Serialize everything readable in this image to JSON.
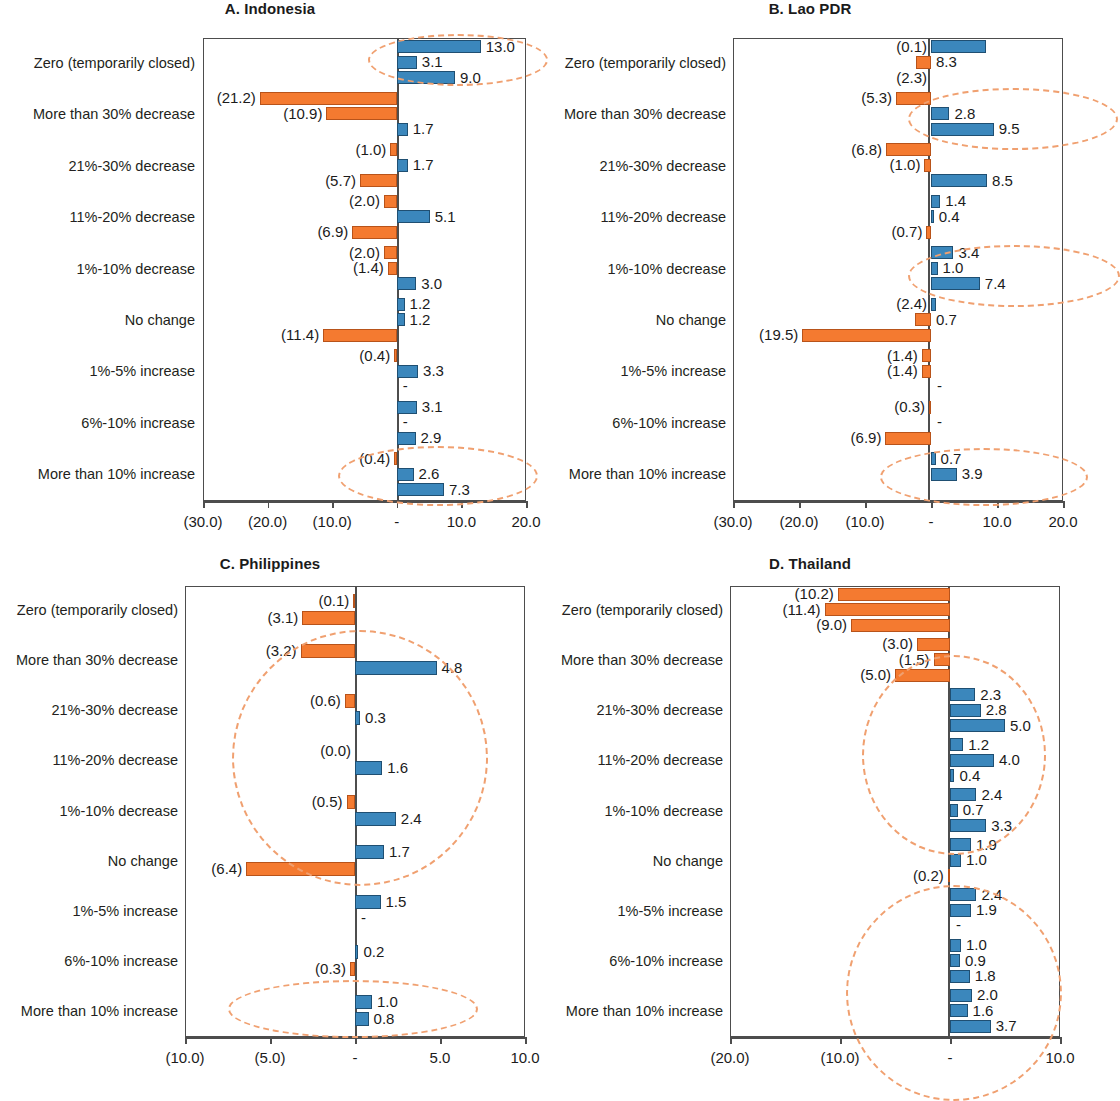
{
  "figure": {
    "panels": [
      "A. Indonesia",
      "B. Lao PDR",
      "C. Philippines",
      "D. Thailand"
    ],
    "categories": [
      "Zero (temporarily closed)",
      "More than 30% decrease",
      "21%-30% decrease",
      "11%-20% decrease",
      "1%-10% decrease",
      "No change",
      "1%-5% increase",
      "6%-10% increase",
      "More than 10% increase"
    ],
    "colors": {
      "positive": "#3b87bc",
      "negative": "#f47a30",
      "highlight": "#f0a070",
      "axis": "#4d4d4d"
    }
  },
  "chart_data": [
    {
      "type": "bar",
      "title": "A. Indonesia",
      "xlabel": "",
      "ylabel": "",
      "orientation": "horizontal",
      "xlim": [
        -30.0,
        20.0
      ],
      "xticks": [
        -30.0,
        -20.0,
        -10.0,
        0.0,
        10.0,
        20.0
      ],
      "xticklabels": [
        "(30.0)",
        "(20.0)",
        "(10.0)",
        "-",
        "10.0",
        "20.0"
      ],
      "grid": false,
      "legend": "none",
      "categories": [
        "Zero (temporarily closed)",
        "More than 30% decrease",
        "21%-30% decrease",
        "11%-20% decrease",
        "1%-10% decrease",
        "No change",
        "1%-5% increase",
        "6%-10% increase",
        "More than 10% increase"
      ],
      "series": [
        {
          "name": "row1",
          "values": [
            13.0,
            -21.2,
            -1.0,
            -2.0,
            -2.0,
            1.2,
            -0.4,
            3.1,
            -0.4
          ]
        },
        {
          "name": "row2",
          "values": [
            3.1,
            -10.9,
            1.7,
            5.1,
            -1.4,
            1.2,
            3.3,
            0.0,
            2.6
          ]
        },
        {
          "name": "row3",
          "values": [
            9.0,
            1.7,
            -5.7,
            -6.9,
            3.0,
            -11.4,
            0.0,
            2.9,
            7.3
          ]
        }
      ],
      "labels": [
        [
          "13.0",
          "3.1",
          "9.0"
        ],
        [
          "(21.2)",
          "(10.9)",
          "1.7"
        ],
        [
          "(1.0)",
          "1.7",
          "(5.7)"
        ],
        [
          "(2.0)",
          "5.1",
          "(6.9)"
        ],
        [
          "(2.0)",
          "(1.4)",
          "3.0"
        ],
        [
          "1.2",
          "1.2",
          "(11.4)"
        ],
        [
          "(0.4)",
          "3.3",
          "-"
        ],
        [
          "3.1",
          "-",
          "2.9"
        ],
        [
          "(0.4)",
          "2.6",
          "7.3"
        ]
      ],
      "highlight_regions": [
        "Zero (temporarily closed)",
        "More than 10% increase"
      ]
    },
    {
      "type": "bar",
      "title": "B. Lao PDR",
      "xlabel": "",
      "ylabel": "",
      "orientation": "horizontal",
      "xlim": [
        -30.0,
        20.0
      ],
      "xticks": [
        -30.0,
        -20.0,
        -10.0,
        0.0,
        10.0,
        20.0
      ],
      "xticklabels": [
        "(30.0)",
        "(20.0)",
        "(10.0)",
        "-",
        "10.0",
        "20.0"
      ],
      "grid": false,
      "legend": "none",
      "categories": [
        "Zero (temporarily closed)",
        "More than 30% decrease",
        "21%-30% decrease",
        "11%-20% decrease",
        "1%-10% decrease",
        "No change",
        "1%-5% increase",
        "6%-10% increase",
        "More than 10% increase"
      ],
      "series": [
        {
          "name": "row1",
          "values": [
            8.3,
            -5.3,
            -6.8,
            1.4,
            3.4,
            0.7,
            -1.4,
            -0.3,
            0.7
          ]
        },
        {
          "name": "row2",
          "values": [
            -2.3,
            2.8,
            -1.0,
            0.4,
            1.0,
            -2.4,
            -1.4,
            0.0,
            3.9
          ]
        },
        {
          "name": "row3",
          "values": [
            0.0,
            9.5,
            8.5,
            -0.7,
            7.4,
            -19.5,
            0.0,
            -6.9,
            0.0
          ]
        }
      ],
      "labels": [
        [
          "(0.1)",
          "8.3",
          "(2.3)"
        ],
        [
          "(5.3)",
          "2.8",
          "9.5"
        ],
        [
          "(6.8)",
          "(1.0)",
          "8.5"
        ],
        [
          "1.4",
          "0.4",
          "(0.7)"
        ],
        [
          "3.4",
          "1.0",
          "7.4"
        ],
        [
          "(2.4)",
          "0.7",
          "(19.5)"
        ],
        [
          "(1.4)",
          "(1.4)",
          "-"
        ],
        [
          "(0.3)",
          "-",
          "(6.9)"
        ],
        [
          "0.7",
          "3.9",
          ""
        ]
      ],
      "highlight_regions": [
        "More than 30% decrease",
        "1%-10% decrease",
        "More than 10% increase"
      ]
    },
    {
      "type": "bar",
      "title": "C. Philippines",
      "xlabel": "",
      "ylabel": "",
      "orientation": "horizontal",
      "xlim": [
        -10.0,
        10.0
      ],
      "xticks": [
        -10.0,
        -5.0,
        0.0,
        5.0,
        10.0
      ],
      "xticklabels": [
        "(10.0)",
        "(5.0)",
        "-",
        "5.0",
        "10.0"
      ],
      "grid": false,
      "legend": "none",
      "categories": [
        "Zero (temporarily closed)",
        "More than 30% decrease",
        "21%-30% decrease",
        "11%-20% decrease",
        "1%-10% decrease",
        "No change",
        "1%-5% increase",
        "6%-10% increase",
        "More than 10% increase"
      ],
      "series": [
        {
          "name": "row1",
          "values": [
            -0.1,
            -3.2,
            -0.6,
            0.0,
            -0.5,
            1.7,
            1.5,
            0.2,
            1.0
          ]
        },
        {
          "name": "row2",
          "values": [
            -3.1,
            4.8,
            0.3,
            1.6,
            2.4,
            -6.4,
            0.0,
            -0.3,
            0.8
          ]
        }
      ],
      "labels": [
        [
          "(0.1)",
          "(3.1)"
        ],
        [
          "(3.2)",
          "4.8"
        ],
        [
          "(0.6)",
          "0.3"
        ],
        [
          "(0.0)",
          "1.6"
        ],
        [
          "(0.5)",
          "2.4"
        ],
        [
          "1.7",
          "(6.4)"
        ],
        [
          "1.5",
          "-"
        ],
        [
          "0.2",
          "(0.3)"
        ],
        [
          "1.0",
          "0.8"
        ]
      ],
      "highlight_regions": [
        "More than 30% decrease",
        "1%-10% decrease",
        "More than 10% increase"
      ]
    },
    {
      "type": "bar",
      "title": "D. Thailand",
      "xlabel": "",
      "ylabel": "",
      "orientation": "horizontal",
      "xlim": [
        -20.0,
        10.0
      ],
      "xticks": [
        -20.0,
        -10.0,
        0.0,
        10.0
      ],
      "xticklabels": [
        "(20.0)",
        "(10.0)",
        "-",
        "10.0"
      ],
      "grid": false,
      "legend": "none",
      "categories": [
        "Zero (temporarily closed)",
        "More than 30% decrease",
        "21%-30% decrease",
        "11%-20% decrease",
        "1%-10% decrease",
        "No change",
        "1%-5% increase",
        "6%-10% increase",
        "More than 10% increase"
      ],
      "series": [
        {
          "name": "row1",
          "values": [
            -10.2,
            -3.0,
            2.3,
            1.2,
            2.4,
            1.9,
            2.4,
            1.0,
            2.0
          ]
        },
        {
          "name": "row2",
          "values": [
            -11.4,
            -1.5,
            2.8,
            4.0,
            0.7,
            1.0,
            1.9,
            0.9,
            1.6
          ]
        },
        {
          "name": "row3",
          "values": [
            -9.0,
            -5.0,
            5.0,
            0.4,
            3.3,
            -0.2,
            0.0,
            1.8,
            3.7
          ]
        }
      ],
      "labels": [
        [
          "(10.2)",
          "(11.4)",
          "(9.0)"
        ],
        [
          "(3.0)",
          "(1.5)",
          "(5.0)"
        ],
        [
          "2.3",
          "2.8",
          "5.0"
        ],
        [
          "1.2",
          "4.0",
          "0.4"
        ],
        [
          "2.4",
          "0.7",
          "3.3"
        ],
        [
          "1.9",
          "1.0",
          "(0.2)"
        ],
        [
          "2.4",
          "1.9",
          "-"
        ],
        [
          "1.0",
          "0.9",
          "1.8"
        ],
        [
          "2.0",
          "1.6",
          "3.7"
        ]
      ],
      "highlight_regions": [
        "21%-30% decrease",
        "1%-5% increase",
        "More than 10% increase"
      ]
    }
  ]
}
